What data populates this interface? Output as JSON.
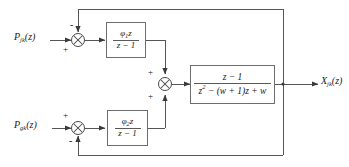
{
  "diagram": {
    "canvas": {
      "width": 349,
      "height": 167
    },
    "line_color": "#555555",
    "text_color": "#1a1a1a",
    "box_border_color": "#6d6d6d"
  },
  "inputs": [
    {
      "id": "input-top",
      "base": "P",
      "subscript": "jk",
      "arg": "(z)",
      "full": "P_jk(z)"
    },
    {
      "id": "input-bottom",
      "base": "P",
      "subscript": "gk",
      "arg": "(z)",
      "full": "P_gk(z)"
    }
  ],
  "outputs": [
    {
      "id": "output-x",
      "base": "X",
      "subscript": "jk",
      "arg": "(z)",
      "full": "X_jk(z)"
    }
  ],
  "summers": [
    {
      "id": "summer-top",
      "inputs": [
        {
          "port": "left",
          "sign": "+"
        },
        {
          "port": "top",
          "sign": "-"
        }
      ]
    },
    {
      "id": "summer-center",
      "inputs": [
        {
          "port": "top",
          "sign": "+"
        },
        {
          "port": "bottom",
          "sign": "+"
        }
      ]
    },
    {
      "id": "summer-bottom",
      "inputs": [
        {
          "port": "left",
          "sign": "+"
        },
        {
          "port": "bottom",
          "sign": "-"
        }
      ]
    }
  ],
  "blocks": [
    {
      "id": "controller-1",
      "numerator": "φ1z",
      "numerator_base": "φ",
      "numerator_sub": "1",
      "numerator_tail": "z",
      "denominator": "z − 1",
      "label": "φ1z / (z−1)"
    },
    {
      "id": "controller-2",
      "numerator": "φ2z",
      "numerator_base": "φ",
      "numerator_sub": "2",
      "numerator_tail": "z",
      "denominator": "z − 1",
      "label": "φ2z / (z−1)"
    },
    {
      "id": "plant",
      "numerator": "z − 1",
      "denominator_lead": "z",
      "denominator_exp": "2",
      "denominator_tail": " − (w + 1)z + w",
      "denominator": "z² − (w + 1)z + w",
      "label": "(z−1) / (z² − (w+1)z + w)"
    }
  ],
  "signs": {
    "plus": "+",
    "minus": "−"
  }
}
